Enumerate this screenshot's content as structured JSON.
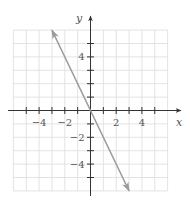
{
  "chart_data": {
    "type": "line",
    "title": "",
    "xlabel": "x",
    "ylabel": "y",
    "xlim": [
      -6,
      6
    ],
    "ylim": [
      -6,
      6
    ],
    "grid": true,
    "legend": null,
    "x_ticks": [
      -5,
      -4,
      -3,
      -2,
      -1,
      0,
      1,
      2,
      3,
      4,
      5
    ],
    "y_ticks": [
      -5,
      -4,
      -3,
      -2,
      -1,
      0,
      1,
      2,
      3,
      4,
      5
    ],
    "x_tick_labels": [
      {
        "value": -4,
        "label": "−4"
      },
      {
        "value": -2,
        "label": "−2"
      },
      {
        "value": 2,
        "label": "2"
      },
      {
        "value": 4,
        "label": "4"
      }
    ],
    "y_tick_labels": [
      {
        "value": 4,
        "label": "4"
      },
      {
        "value": -2,
        "label": "−2"
      },
      {
        "value": -4,
        "label": "−4"
      }
    ],
    "series": [
      {
        "name": "y = -2x",
        "x": [
          -3,
          3
        ],
        "y": [
          6,
          -6
        ],
        "arrows_both_ends": true,
        "color": "#9a9a9a"
      }
    ]
  },
  "colors": {
    "grid": "#dcdcdc",
    "axis": "#333333",
    "line": "#9a9a9a",
    "text": "#555555"
  }
}
